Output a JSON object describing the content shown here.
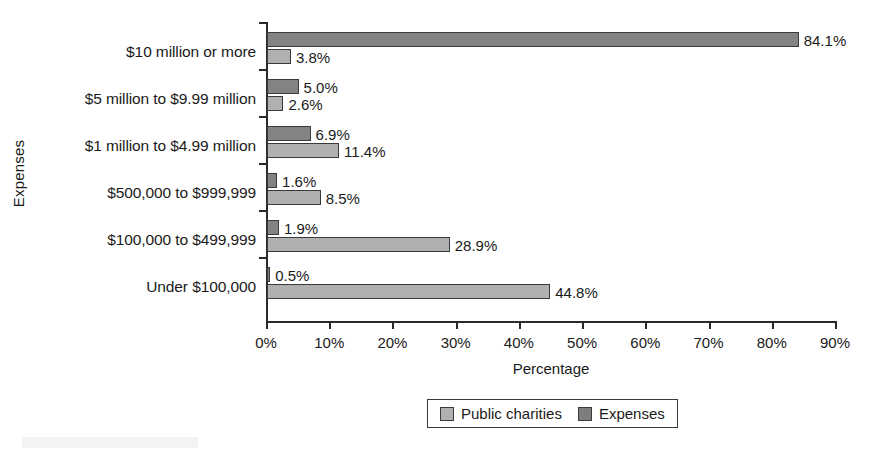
{
  "chart_data": {
    "type": "bar",
    "orientation": "horizontal",
    "title": "",
    "xlabel": "Percentage",
    "ylabel": "Expenses",
    "xlim": [
      0,
      90
    ],
    "xtick_labels": [
      "0%",
      "10%",
      "20%",
      "30%",
      "40%",
      "50%",
      "60%",
      "70%",
      "80%",
      "90%"
    ],
    "xticks": [
      0,
      10,
      20,
      30,
      40,
      50,
      60,
      70,
      80,
      90
    ],
    "grid": false,
    "legend_position": "bottom-center",
    "categories": [
      "$10 million or more",
      "$5 million to $9.99 million",
      "$1 million to $4.99 million",
      "$500,000 to $999,999",
      "$100,000 to $499,999",
      "Under $100,000"
    ],
    "series": [
      {
        "name": "Expenses",
        "color": "#838383",
        "values": [
          84.1,
          5.0,
          6.9,
          1.6,
          1.9,
          0.5
        ],
        "labels": [
          "84.1%",
          "5.0%",
          "6.9%",
          "1.6%",
          "1.9%",
          "0.5%"
        ]
      },
      {
        "name": "Public charities",
        "color": "#b0b0b0",
        "values": [
          3.8,
          2.6,
          11.4,
          8.5,
          28.9,
          44.8
        ],
        "labels": [
          "3.8%",
          "2.6%",
          "11.4%",
          "8.5%",
          "28.9%",
          "44.8%"
        ]
      }
    ]
  },
  "legend": {
    "items": [
      {
        "label": "Public charities",
        "swatch": "public"
      },
      {
        "label": "Expenses",
        "swatch": "expenses"
      }
    ]
  }
}
